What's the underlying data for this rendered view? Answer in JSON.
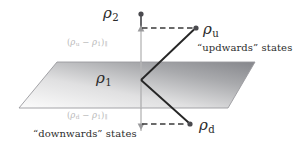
{
  "figure": {
    "width": 307,
    "height": 153,
    "background": "#ffffff"
  },
  "colors": {
    "axis_dark": "#55565a",
    "axis_light": "#c3c3c3",
    "plane_dark": "#8f9094",
    "plane_light": "#fbfbfb",
    "plane_edge": "#9a9a9e",
    "vector_line": "#262626",
    "dashed_line": "#3a3a3a",
    "point_marker": "#4a4a4e",
    "text_main": "#2b2b2b",
    "text_faint": "#b9b9b9"
  },
  "labels": {
    "rho2": {
      "symbol": "ρ",
      "subscript": "2"
    },
    "rho1": {
      "symbol": "ρ",
      "subscript": "1"
    },
    "rho_u": {
      "symbol": "ρ",
      "subscript": "u"
    },
    "rho_d": {
      "symbol": "ρ",
      "subscript": "d"
    },
    "projection_up": {
      "open": "(",
      "symbol1": "ρ",
      "sub1": "u",
      "operator": " − ",
      "symbol2": "ρ",
      "sub2": "1",
      "close": ")",
      "sub_close": "∥"
    },
    "projection_down": {
      "open": "(",
      "symbol1": "ρ",
      "sub1": "d",
      "operator": " − ",
      "symbol2": "ρ",
      "sub2": "1",
      "close": ")",
      "sub_close": "∥"
    },
    "updwards_states": "“updwards” states",
    "downwards_states": "“downwards” states"
  },
  "geometry": {
    "plane_corners": "57,62 255,62 228,108 19,108",
    "axis_x": 141,
    "axis_top_y": 14,
    "axis_bottom_y": 131,
    "vertex_rho1": {
      "x": 141,
      "y": 80
    },
    "point_rho2": {
      "x": 141,
      "y": 14
    },
    "point_rho_u": {
      "x": 196,
      "y": 28
    },
    "point_rho_d": {
      "x": 190,
      "y": 124
    },
    "dash_up_y": 28,
    "dash_down_y": 124
  }
}
